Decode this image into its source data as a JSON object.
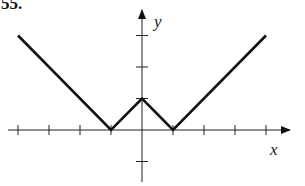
{
  "problem_number": "55.",
  "chart_data": {
    "type": "line",
    "title": "",
    "xlabel": "x",
    "ylabel": "y",
    "x": [
      -4,
      -1,
      0,
      1,
      4
    ],
    "series": [
      {
        "name": "graph",
        "values": [
          3,
          0,
          1,
          0,
          3
        ]
      }
    ],
    "xlim": [
      -4.2,
      4.8
    ],
    "ylim": [
      -1.8,
      3.7
    ],
    "x_ticks": [
      -4,
      -3,
      -2,
      -1,
      1,
      2,
      3,
      4
    ],
    "y_ticks": [
      -1,
      1,
      2,
      3
    ],
    "grid": false,
    "legend": null,
    "color": "#111111"
  },
  "axes": {
    "x_label": "x",
    "y_label": "y"
  }
}
